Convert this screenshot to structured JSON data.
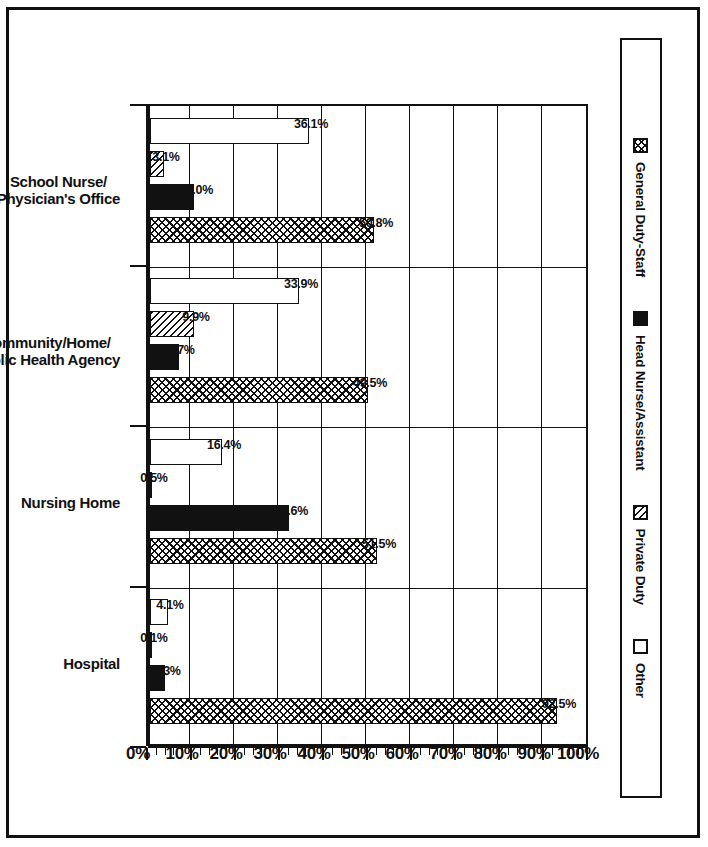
{
  "legend": {
    "entries": [
      {
        "label": "General Duty-Staff",
        "pattern": "crosshatch",
        "swatch_name": "legend-swatch-general-duty-staff"
      },
      {
        "label": "Head Nurse/Assistant",
        "pattern": "solid",
        "swatch_name": "legend-swatch-head-nurse-assistant"
      },
      {
        "label": "Private Duty",
        "pattern": "diagonal",
        "swatch_name": "legend-swatch-private-duty"
      },
      {
        "label": "Other",
        "pattern": "empty",
        "swatch_name": "legend-swatch-other"
      }
    ]
  },
  "axis": {
    "tick_labels": [
      "0%",
      "10%",
      "20%",
      "30%",
      "40%",
      "50%",
      "60%",
      "70%",
      "80%",
      "90%",
      "100%"
    ],
    "min": 0,
    "max": 100,
    "step": 10,
    "minor_step": 2
  },
  "colors": {
    "ink": "#111111",
    "paper": "#ffffff"
  },
  "chart_data": {
    "type": "bar",
    "title": "",
    "subtitle": "",
    "xlabel": "",
    "ylabel": "",
    "ylim": [
      0,
      100
    ],
    "grid": true,
    "orientation": "vertical-rotated-90",
    "legend_position": "top",
    "categories": [
      "School Nurse/\nPhysician's Office",
      "Community/Home/\nPublic Health Agency",
      "Nursing Home",
      "Hospital"
    ],
    "category_lines": [
      [
        "School Nurse/",
        "Physician's Office"
      ],
      [
        "Community/Home/",
        "Public Health Agency"
      ],
      [
        "Nursing Home"
      ],
      [
        "Hospital"
      ]
    ],
    "series": [
      {
        "name": "Other",
        "pattern": "empty",
        "values": [
          36.1,
          33.9,
          16.4,
          4.1
        ],
        "labels": [
          "36.1%",
          "33.9%",
          "16.4%",
          "4.1%"
        ]
      },
      {
        "name": "Private Duty",
        "pattern": "diagonal",
        "values": [
          3.1,
          9.9,
          0.5,
          0.1
        ],
        "labels": [
          "3.1%",
          "9.9%",
          "0.5%",
          "0.1%"
        ]
      },
      {
        "name": "Head Nurse/Assistant",
        "pattern": "solid",
        "values": [
          10.0,
          6.7,
          31.6,
          3.3
        ],
        "labels": [
          "10.0%",
          "6.7%",
          "31.6%",
          "3.3%"
        ]
      },
      {
        "name": "General Duty-Staff",
        "pattern": "crosshatch",
        "values": [
          50.8,
          49.5,
          51.5,
          92.5
        ],
        "labels": [
          "50.8%",
          "49.5%",
          "51.5%",
          "92.5%"
        ]
      }
    ]
  }
}
